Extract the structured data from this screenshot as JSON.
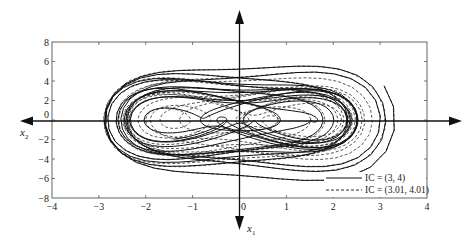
{
  "chart_data": {
    "type": "line",
    "title": "",
    "xlabel": "x1",
    "ylabel": "x2",
    "xlim": [
      -4,
      4
    ],
    "ylim": [
      -8,
      8
    ],
    "xticks": [
      -4,
      -3,
      -2,
      -1,
      0,
      1,
      2,
      3,
      4
    ],
    "yticks": [
      -8,
      -6,
      -4,
      -2,
      0,
      2,
      4,
      6,
      8
    ],
    "grid": false,
    "legend_position": "bottom-right",
    "series": [
      {
        "name": "IC = (3, 4)",
        "style": "solid",
        "initial_condition": [
          3,
          4
        ]
      },
      {
        "name": "IC = (3.01, 4.01)",
        "style": "dashed",
        "initial_condition": [
          3.01,
          4.01
        ]
      }
    ],
    "x_range_observed": [
      -3.4,
      3.3
    ],
    "y_range_observed": [
      -6.2,
      6.2
    ]
  },
  "labels": {
    "x_axis_name": "x",
    "x_axis_sub": "1",
    "y_axis_name": "x",
    "y_axis_sub": "2",
    "legend": [
      "IC = (3, 4)",
      "IC = (3.01, 4.01)"
    ]
  }
}
